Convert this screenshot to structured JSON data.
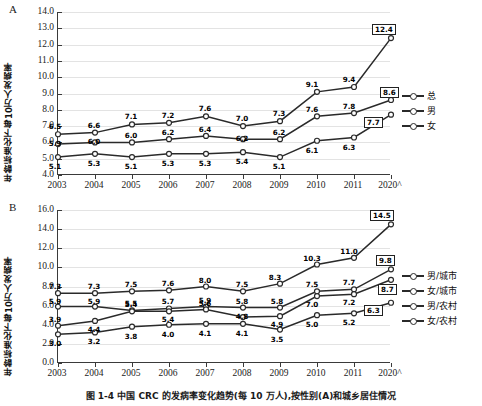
{
  "figure": {
    "caption": "图 1-4  中国 CRC 的发病率变化趋势(每 10 万人),按性别(A)和城乡居住情况"
  },
  "chart_data": [
    {
      "type": "line",
      "panel_letter": "A",
      "title": "",
      "xlabel": "",
      "ylabel": "年龄标准化下每10万人发病率",
      "categories": [
        "2003",
        "2004",
        "2005",
        "2006",
        "2007",
        "2008",
        "2009",
        "2010",
        "2011",
        "2020^"
      ],
      "ylim": [
        4.0,
        14.0
      ],
      "yticks": [
        "4.0",
        "5.0",
        "6.0",
        "7.0",
        "8.0",
        "9.0",
        "10.0",
        "11.0",
        "12.0",
        "13.0",
        "14.0"
      ],
      "grid": true,
      "legend_position": "right",
      "series": [
        {
          "name": "男",
          "values": [
            6.5,
            6.6,
            7.1,
            7.2,
            7.6,
            7.0,
            7.3,
            9.1,
            9.4,
            12.4
          ],
          "labels": [
            "6.5",
            "6.6",
            "7.1",
            "7.2",
            "7.6",
            "7.0",
            "7.3",
            "9.1",
            "9.4",
            "12.4"
          ],
          "boxed_last": true
        },
        {
          "name": "总",
          "values": [
            5.9,
            6.0,
            6.0,
            6.2,
            6.4,
            6.2,
            6.2,
            7.6,
            7.8,
            8.6
          ],
          "labels": [
            "5.9",
            "6.0",
            "6.0",
            "6.2",
            "6.4",
            "6.2",
            "6.2",
            "7.6",
            "7.8",
            "8.6"
          ],
          "boxed_last": true
        },
        {
          "name": "女",
          "values": [
            5.1,
            5.3,
            5.1,
            5.3,
            5.3,
            5.4,
            5.1,
            6.1,
            6.3,
            7.7
          ],
          "labels": [
            "5.1",
            "5.3",
            "5.1",
            "5.3",
            "5.3",
            "5.4",
            "5.1",
            "6.1",
            "6.3",
            "7.7"
          ],
          "boxed_last": true
        }
      ],
      "legend": [
        "总",
        "男",
        "女"
      ]
    },
    {
      "type": "line",
      "panel_letter": "B",
      "title": "",
      "xlabel": "",
      "ylabel": "年龄标准化下每10万人发病率",
      "categories": [
        "2003",
        "2004",
        "2005",
        "2006",
        "2007",
        "2008",
        "2009",
        "2010",
        "2011",
        "2020^"
      ],
      "ylim": [
        0.0,
        16.0
      ],
      "yticks": [
        "0.0",
        "2.0",
        "4.0",
        "6.0",
        "8.0",
        "10.0",
        "12.0",
        "14.0",
        "16.0"
      ],
      "grid": true,
      "legend_position": "right",
      "series": [
        {
          "name": "男/城市",
          "values": [
            7.3,
            7.3,
            7.5,
            7.6,
            8.0,
            7.5,
            8.3,
            10.3,
            11.0,
            14.5
          ],
          "labels": [
            "7.3",
            "7.3",
            "7.5",
            "7.6",
            "8.0",
            "7.5",
            "8.3",
            "10.3",
            "11.0",
            "14.5"
          ],
          "boxed_last": true
        },
        {
          "name": "女/城市",
          "values": [
            5.9,
            5.9,
            5.5,
            5.7,
            5.9,
            5.8,
            5.8,
            7.5,
            7.7,
            9.8
          ],
          "labels": [
            "5.9",
            "5.9",
            "5.5",
            "5.7",
            "5.9",
            "5.8",
            "5.8",
            "7.5",
            "7.7",
            "9.8"
          ],
          "boxed_last": true
        },
        {
          "name": "男/农村",
          "values": [
            3.9,
            4.4,
            5.4,
            5.4,
            5.6,
            4.8,
            4.9,
            7.0,
            7.2,
            8.7
          ],
          "labels": [
            "3.9",
            "4.4",
            "5.4",
            "5.4",
            "5.6",
            "4.8",
            "4.9",
            "7.0",
            "7.2",
            "8.7"
          ],
          "boxed_last": true
        },
        {
          "name": "女/农村",
          "values": [
            3.0,
            3.2,
            3.8,
            4.0,
            4.1,
            4.1,
            3.5,
            5.0,
            5.2,
            6.3
          ],
          "labels": [
            "3.0",
            "3.2",
            "3.8",
            "4.0",
            "4.1",
            "4.1",
            "3.5",
            "5.0",
            "5.2",
            "6.3"
          ],
          "boxed_last": true
        }
      ],
      "legend": [
        "男/城市",
        "女/城市",
        "男/农村",
        "女/农村"
      ]
    }
  ]
}
